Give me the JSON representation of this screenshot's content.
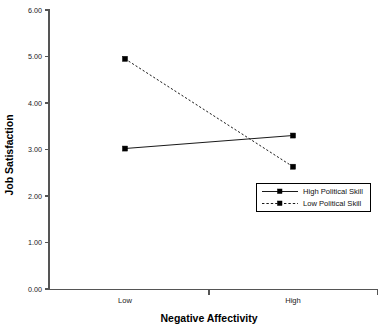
{
  "chart_data": {
    "type": "line",
    "title": "",
    "xlabel": "Negative Affectivity",
    "ylabel": "Job Satisfaction",
    "categories": [
      "Low",
      "High"
    ],
    "x": [
      0,
      1
    ],
    "ylim": [
      0.0,
      6.0
    ],
    "ytick_labels": [
      "0.00",
      "1.00",
      "2.00",
      "3.00",
      "4.00",
      "5.00",
      "6.00"
    ],
    "ytick_values": [
      0.0,
      1.0,
      2.0,
      3.0,
      4.0,
      5.0,
      6.0
    ],
    "grid": false,
    "legend_position": "inside-right",
    "series": [
      {
        "name": "High Political Skill",
        "values": [
          3.02,
          3.3
        ],
        "style": "solid",
        "marker": "square",
        "color": "#1a1a1a"
      },
      {
        "name": "Low Political Skill",
        "values": [
          4.95,
          2.63
        ],
        "style": "dashed",
        "marker": "square",
        "color": "#1a1a1a"
      }
    ],
    "colors": {
      "axis": "#555555",
      "series": "#1a1a1a",
      "legend_border": "#000000",
      "background": "#ffffff"
    }
  },
  "legend": {
    "entries": [
      {
        "label": "High Political Skill",
        "style": "solid"
      },
      {
        "label": "Low Political Skill",
        "style": "dashed"
      }
    ]
  },
  "axes": {
    "y": {
      "title": "Job Satisfaction",
      "ticks": [
        "6.00",
        "5.00",
        "4.00",
        "3.00",
        "2.00",
        "1.00",
        "0.00"
      ]
    },
    "x": {
      "title": "Negative Affectivity",
      "ticks": [
        "Low",
        "High"
      ]
    }
  }
}
